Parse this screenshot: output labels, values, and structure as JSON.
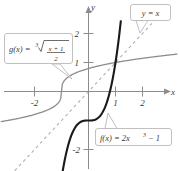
{
  "figure": {
    "type": "graph",
    "background_color": "#ffffff",
    "axes": {
      "x_label": "x",
      "y_label": "y",
      "x_ticks": [
        "-2",
        "1",
        "2"
      ],
      "y_ticks": [
        "2",
        "1",
        "-2"
      ],
      "x_range": [
        -3.2,
        3.3
      ],
      "y_range": [
        -2.8,
        2.9
      ],
      "axis_color": "#8c8c8c"
    },
    "callouts": {
      "g_label": {
        "name": "g(x)",
        "prefix": "g(x) =",
        "root_index": "3",
        "numerator": "x + 1",
        "denominator": "2",
        "full_text": "g(x) = cbrt((x + 1)/2)"
      },
      "f_label": {
        "name": "f(x)",
        "prefix": "f(x) = 2x",
        "exponent": "3",
        "suffix": "− 1",
        "full_text": "f(x) = 2x^3 − 1"
      },
      "identity_label": {
        "text": "y = x",
        "full_text": "y = x"
      }
    },
    "curves": {
      "f": {
        "label": "f(x) = 2x^3 - 1",
        "color": "#1a1a1a",
        "style": "solid"
      },
      "g": {
        "label": "g(x) = cbrt((x+1)/2)",
        "color": "#8c8c8c",
        "style": "solid"
      },
      "identity": {
        "label": "y = x",
        "color": "#b0b0b0",
        "style": "dashed"
      }
    }
  },
  "chart_data": {
    "type": "line",
    "title": "",
    "xlabel": "x",
    "ylabel": "y",
    "xlim": [
      -3.2,
      3.3
    ],
    "ylim": [
      -2.8,
      2.9
    ],
    "grid": false,
    "legend": "callout-labels",
    "xticks": [
      -2,
      1,
      2
    ],
    "yticks": [
      2,
      1,
      -2
    ],
    "series": [
      {
        "name": "f(x) = 2x^3 - 1",
        "color": "#1a1a1a",
        "style": "solid",
        "x": [
          -1.05,
          -0.9,
          -0.75,
          -0.6,
          -0.45,
          -0.3,
          -0.15,
          0,
          0.15,
          0.3,
          0.45,
          0.6,
          0.75,
          0.9,
          1.0,
          1.1,
          1.2
        ],
        "y": [
          -3.31,
          -2.46,
          -1.84,
          -1.43,
          -1.18,
          -1.05,
          -1.01,
          -1.0,
          -0.99,
          -0.95,
          -0.82,
          -0.57,
          -0.16,
          0.46,
          1.0,
          1.66,
          2.46
        ]
      },
      {
        "name": "g(x) = cbrt((x+1)/2)",
        "color": "#8c8c8c",
        "style": "solid",
        "x": [
          -3.3,
          -2.45,
          -1.84,
          -1.43,
          -1.18,
          -1.05,
          -1.01,
          -1.0,
          -0.99,
          -0.95,
          -0.82,
          -0.57,
          -0.16,
          0.46,
          1.0,
          1.66,
          2.46,
          3.3
        ],
        "y": [
          -1.19,
          -1.05,
          -0.9,
          -0.75,
          -0.6,
          -0.45,
          -0.3,
          0,
          0.15,
          0.3,
          0.45,
          0.6,
          0.75,
          0.9,
          1.0,
          1.1,
          1.2,
          1.3
        ]
      },
      {
        "name": "y = x",
        "color": "#b0b0b0",
        "style": "dashed",
        "x": [
          -3.2,
          2.9
        ],
        "y": [
          -3.2,
          2.9
        ]
      }
    ]
  }
}
